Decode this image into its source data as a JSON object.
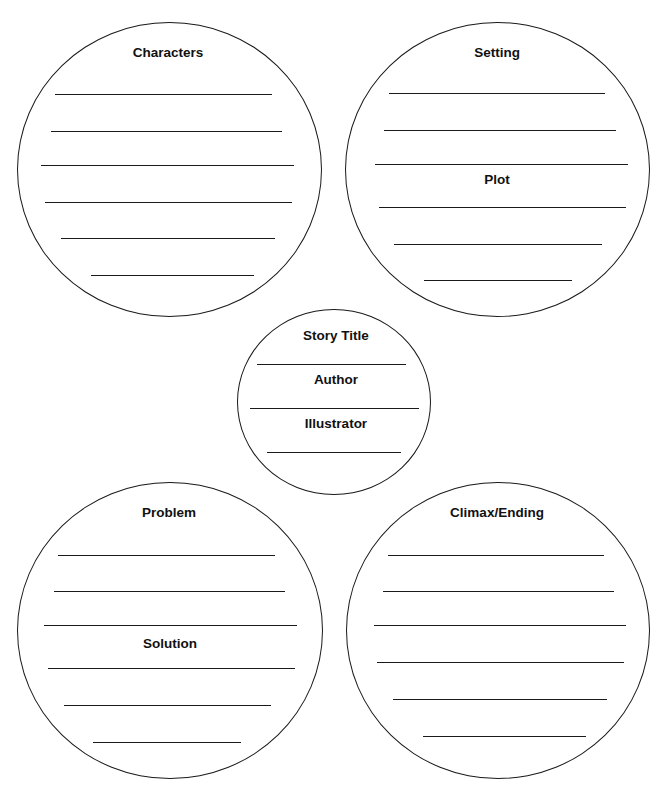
{
  "worksheet": {
    "circles": [
      {
        "id": "characters",
        "box": {
          "left": 17,
          "top": 22,
          "width": 305,
          "height": 295
        },
        "labels": [
          {
            "text": "Characters",
            "x": 168,
            "y": 52
          }
        ],
        "lines": [
          {
            "y": 94,
            "x1": 55,
            "x2": 272
          },
          {
            "y": 131,
            "x1": 51,
            "x2": 282
          },
          {
            "y": 165,
            "x1": 41,
            "x2": 294
          },
          {
            "y": 202,
            "x1": 45,
            "x2": 292
          },
          {
            "y": 238,
            "x1": 61,
            "x2": 275
          },
          {
            "y": 275,
            "x1": 91,
            "x2": 254
          }
        ]
      },
      {
        "id": "setting-plot",
        "box": {
          "left": 345,
          "top": 22,
          "width": 305,
          "height": 295
        },
        "labels": [
          {
            "text": "Setting",
            "x": 497,
            "y": 52
          },
          {
            "text": "Plot",
            "x": 497,
            "y": 179
          }
        ],
        "lines": [
          {
            "y": 93,
            "x1": 389,
            "x2": 605
          },
          {
            "y": 130,
            "x1": 384,
            "x2": 616
          },
          {
            "y": 164,
            "x1": 375,
            "x2": 628
          },
          {
            "y": 207,
            "x1": 379,
            "x2": 626
          },
          {
            "y": 244,
            "x1": 394,
            "x2": 602
          },
          {
            "y": 280,
            "x1": 424,
            "x2": 572
          }
        ]
      },
      {
        "id": "title-author-illustrator",
        "box": {
          "left": 237,
          "top": 309,
          "width": 194,
          "height": 186
        },
        "labels": [
          {
            "text": "Story Title",
            "x": 336,
            "y": 335
          },
          {
            "text": "Author",
            "x": 336,
            "y": 379
          },
          {
            "text": "Illustrator",
            "x": 336,
            "y": 423
          }
        ],
        "lines": [
          {
            "y": 364,
            "x1": 257,
            "x2": 406
          },
          {
            "y": 408,
            "x1": 250,
            "x2": 419
          },
          {
            "y": 452,
            "x1": 267,
            "x2": 401
          }
        ]
      },
      {
        "id": "problem-solution",
        "box": {
          "left": 17,
          "top": 482,
          "width": 306,
          "height": 297
        },
        "labels": [
          {
            "text": "Problem",
            "x": 169,
            "y": 512
          },
          {
            "text": "Solution",
            "x": 170,
            "y": 643
          }
        ],
        "lines": [
          {
            "y": 555,
            "x1": 58,
            "x2": 275
          },
          {
            "y": 591,
            "x1": 54,
            "x2": 285
          },
          {
            "y": 625,
            "x1": 44,
            "x2": 297
          },
          {
            "y": 668,
            "x1": 48,
            "x2": 295
          },
          {
            "y": 705,
            "x1": 64,
            "x2": 271
          },
          {
            "y": 742,
            "x1": 93,
            "x2": 241
          }
        ]
      },
      {
        "id": "climax-ending",
        "box": {
          "left": 346,
          "top": 482,
          "width": 304,
          "height": 297
        },
        "labels": [
          {
            "text": "Climax/Ending",
            "x": 497,
            "y": 512
          }
        ],
        "lines": [
          {
            "y": 555,
            "x1": 388,
            "x2": 604
          },
          {
            "y": 591,
            "x1": 383,
            "x2": 614
          },
          {
            "y": 625,
            "x1": 374,
            "x2": 626
          },
          {
            "y": 662,
            "x1": 377,
            "x2": 624
          },
          {
            "y": 699,
            "x1": 393,
            "x2": 607
          },
          {
            "y": 736,
            "x1": 423,
            "x2": 586
          }
        ]
      }
    ]
  }
}
